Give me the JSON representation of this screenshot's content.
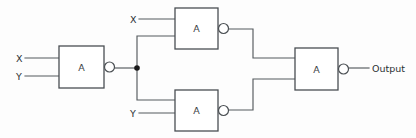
{
  "diagram": {
    "background_color": "#fdfdfd",
    "line_color": "#555a5e",
    "gate_stroke_color": "#4a4f53",
    "junction_color": "#1a1a1a",
    "text_color": "#2c3034"
  },
  "gates": [
    {
      "id": "gate-1",
      "label": "A",
      "x": 59,
      "y": 46,
      "w": 45,
      "h": 42,
      "bubble": true
    },
    {
      "id": "gate-2",
      "label": "A",
      "x": 175,
      "y": 8,
      "w": 43,
      "h": 41,
      "bubble": true
    },
    {
      "id": "gate-3",
      "label": "A",
      "x": 175,
      "y": 90,
      "w": 43,
      "h": 41,
      "bubble": true
    },
    {
      "id": "gate-4",
      "label": "A",
      "x": 295,
      "y": 48,
      "w": 43,
      "h": 42,
      "bubble": true
    }
  ],
  "inputs": [
    {
      "id": "input-x-1",
      "label": "X",
      "label_x": 16,
      "label_y": 58,
      "wire_y": 58,
      "wire_x1": 25,
      "wire_x2": 59
    },
    {
      "id": "input-y-1",
      "label": "Y",
      "label_x": 16,
      "label_y": 76,
      "wire_y": 76,
      "wire_x1": 25,
      "wire_x2": 59
    },
    {
      "id": "input-x-2",
      "label": "X",
      "label_x": 130,
      "label_y": 19,
      "wire_y": 19,
      "wire_x1": 139,
      "wire_x2": 175
    },
    {
      "id": "input-y-2",
      "label": "Y",
      "label_x": 130,
      "label_y": 113,
      "wire_y": 113,
      "wire_x1": 139,
      "wire_x2": 175
    }
  ],
  "output": {
    "id": "output-terminal",
    "label": "Output",
    "label_x": 372,
    "label_y": 68,
    "wire_x1": 344,
    "wire_x2": 369,
    "wire_y": 68
  },
  "junction": {
    "id": "fanout-node",
    "x": 137,
    "y": 68,
    "radius": 2.8
  },
  "connections": [
    {
      "id": "g1-out-to-junction",
      "points": "110,68 137,68"
    },
    {
      "id": "junction-branch-up",
      "points": "137,68 137,36 175,36"
    },
    {
      "id": "junction-branch-down",
      "points": "137,68 137,100 175,100"
    },
    {
      "id": "g2-out-to-g4",
      "points": "224,29 253,29 253,58 295,58"
    },
    {
      "id": "g3-out-to-g4",
      "points": "224,110 253,110 253,79 295,79"
    }
  ]
}
